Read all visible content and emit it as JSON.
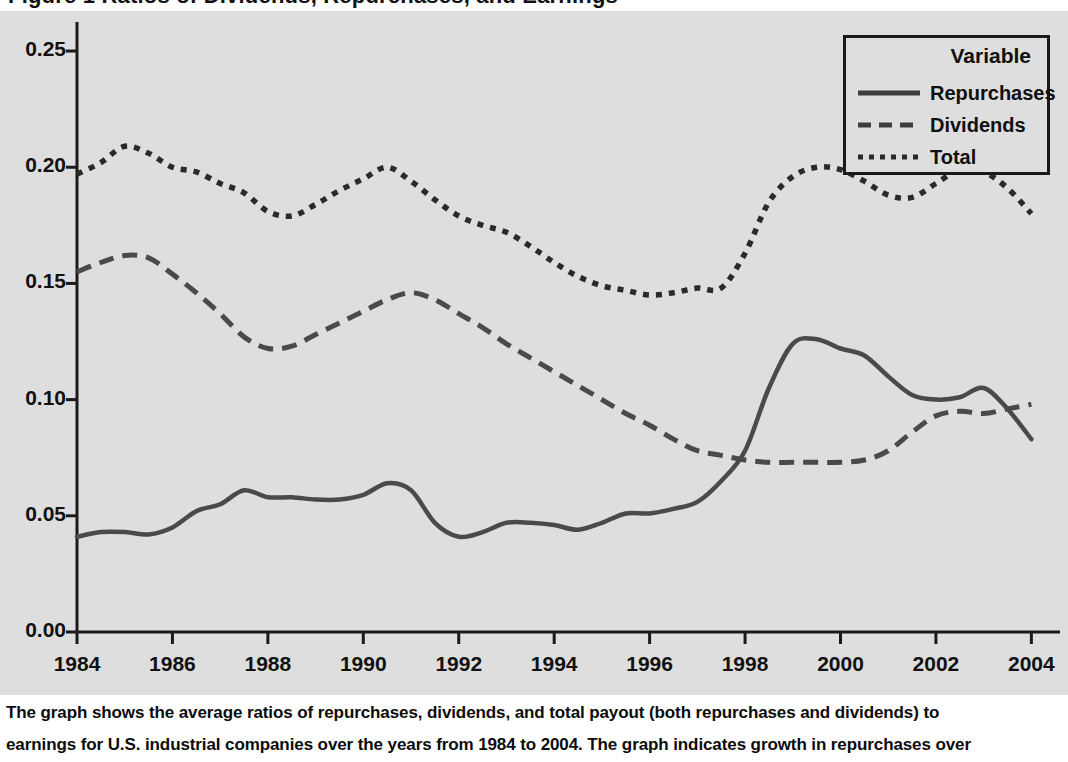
{
  "headline": {
    "text": "Figure 1   Ratios of Dividends, Repurchases, and Earnings"
  },
  "legend": {
    "title": "Variable",
    "items": [
      {
        "label": "Repurchases",
        "style": "solid",
        "icon": "solid-line-icon"
      },
      {
        "label": "Dividends",
        "style": "dashed",
        "icon": "dashed-line-icon"
      },
      {
        "label": "Total",
        "style": "dotted",
        "icon": "dotted-line-icon"
      }
    ]
  },
  "caption": {
    "line1": "The graph shows the average ratios of repurchases, dividends, and total payout (both repurchases and dividends) to",
    "line2": "earnings for U.S. industrial companies over the years from 1984 to 2004. The graph indicates growth in repurchases over"
  },
  "colors": {
    "plot_background": "#dedede",
    "page_background": "#ffffff",
    "axis": "#1a1a1a",
    "series_repurchases": "#4a4a4a",
    "series_dividends": "#4a4a4a",
    "series_total": "#2a2a2a"
  },
  "chart_data": {
    "type": "line",
    "title": "Ratios of Dividends, Repurchases, and Earnings",
    "xlabel": "",
    "ylabel": "",
    "xlim": [
      1984,
      2004.6
    ],
    "ylim": [
      0.0,
      0.2625
    ],
    "grid": false,
    "legend_position": "top-right",
    "xticks": [
      1984,
      1986,
      1988,
      1990,
      1992,
      1994,
      1996,
      1998,
      2000,
      2002,
      2004
    ],
    "xtick_labels": [
      "1984",
      "1986",
      "1988",
      "1990",
      "1992",
      "1994",
      "1996",
      "1998",
      "2000",
      "2002",
      "2004"
    ],
    "yticks": [
      0.0,
      0.05,
      0.1,
      0.15,
      0.2,
      0.25
    ],
    "ytick_labels": [
      "0.00",
      "0.05",
      "0.10",
      "0.15",
      "0.20",
      "0.25"
    ],
    "x": [
      1984,
      1984.5,
      1985,
      1985.5,
      1986,
      1986.5,
      1987,
      1987.5,
      1988,
      1988.5,
      1989,
      1989.5,
      1990,
      1990.5,
      1991,
      1991.5,
      1992,
      1992.5,
      1993,
      1993.5,
      1994,
      1994.5,
      1995,
      1995.5,
      1996,
      1996.5,
      1997,
      1997.5,
      1998,
      1998.5,
      1999,
      1999.5,
      2000,
      2000.5,
      2001,
      2001.5,
      2002,
      2002.5,
      2003,
      2003.5,
      2004
    ],
    "series": [
      {
        "name": "Repurchases",
        "style": "solid",
        "values": [
          0.041,
          0.043,
          0.043,
          0.042,
          0.045,
          0.052,
          0.055,
          0.061,
          0.058,
          0.058,
          0.057,
          0.057,
          0.059,
          0.064,
          0.061,
          0.047,
          0.041,
          0.043,
          0.047,
          0.047,
          0.046,
          0.044,
          0.047,
          0.051,
          0.051,
          0.053,
          0.056,
          0.065,
          0.078,
          0.105,
          0.124,
          0.126,
          0.122,
          0.119,
          0.11,
          0.102,
          0.1,
          0.101,
          0.105,
          0.096,
          0.083
        ]
      },
      {
        "name": "Dividends",
        "style": "dashed",
        "values": [
          0.155,
          0.159,
          0.162,
          0.161,
          0.154,
          0.146,
          0.137,
          0.127,
          0.122,
          0.123,
          0.128,
          0.133,
          0.138,
          0.143,
          0.146,
          0.143,
          0.137,
          0.131,
          0.124,
          0.118,
          0.112,
          0.106,
          0.1,
          0.094,
          0.089,
          0.083,
          0.078,
          0.076,
          0.074,
          0.073,
          0.073,
          0.073,
          0.073,
          0.074,
          0.078,
          0.086,
          0.093,
          0.095,
          0.094,
          0.096,
          0.098
        ]
      },
      {
        "name": "Total",
        "style": "dotted",
        "values": [
          0.197,
          0.202,
          0.209,
          0.206,
          0.2,
          0.198,
          0.193,
          0.189,
          0.181,
          0.179,
          0.184,
          0.19,
          0.195,
          0.2,
          0.194,
          0.186,
          0.179,
          0.175,
          0.172,
          0.166,
          0.159,
          0.153,
          0.149,
          0.147,
          0.145,
          0.146,
          0.148,
          0.148,
          0.163,
          0.185,
          0.196,
          0.2,
          0.199,
          0.194,
          0.188,
          0.187,
          0.193,
          0.199,
          0.198,
          0.191,
          0.18
        ]
      }
    ]
  }
}
